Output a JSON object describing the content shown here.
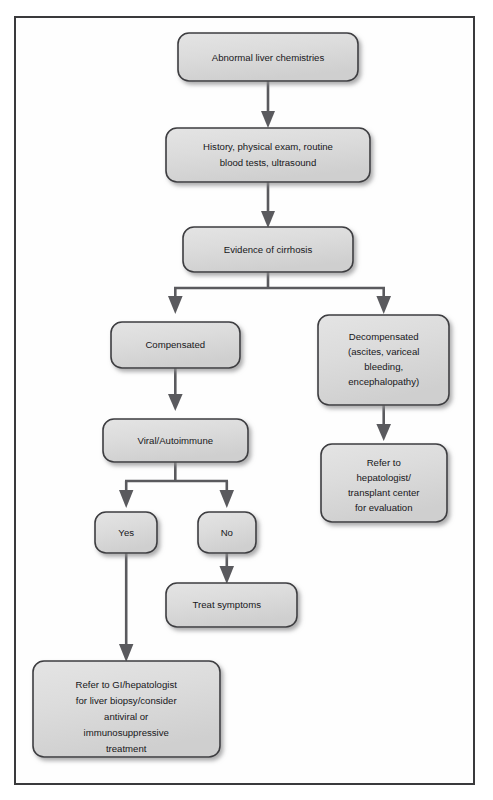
{
  "diagram": {
    "frame": {
      "border_color": "#3a3a3c",
      "background": "#ffffff"
    },
    "style": {
      "box_fill": "#d9d9d9",
      "box_stroke": "#3d3d40",
      "connector_color": "#5a5a5e",
      "text_color": "#17171a"
    },
    "nodes": [
      {
        "id": "abnormal-liver-chemistries",
        "lines": [
          "Abnormal liver chemistries"
        ]
      },
      {
        "id": "history-physical-exam",
        "lines": [
          "History, physical exam, routine",
          "blood tests, ultrasound"
        ]
      },
      {
        "id": "evidence-of-cirrhosis",
        "lines": [
          "Evidence of cirrhosis"
        ]
      },
      {
        "id": "compensated",
        "lines": [
          "Compensated"
        ]
      },
      {
        "id": "decompensated",
        "lines": [
          "Decompensated",
          "(ascites, variceal",
          "bleeding,",
          "encephalopathy)"
        ]
      },
      {
        "id": "viral-autoimmune",
        "lines": [
          "Viral/Autoimmune"
        ]
      },
      {
        "id": "refer-hepatologist-transplant",
        "lines": [
          "Refer to",
          "hepatologist/",
          "transplant center",
          "for evaluation"
        ]
      },
      {
        "id": "yes",
        "lines": [
          "Yes"
        ]
      },
      {
        "id": "no",
        "lines": [
          "No"
        ]
      },
      {
        "id": "treat-symptoms",
        "lines": [
          "Treat symptoms"
        ]
      },
      {
        "id": "refer-gi-hepatologist",
        "lines": [
          "Refer to GI/hepatologist",
          "for liver biopsy/consider",
          "antiviral or",
          "immunosuppressive",
          "treatment"
        ]
      }
    ],
    "edges": [
      {
        "from": "abnormal-liver-chemistries",
        "to": "history-physical-exam",
        "label": ""
      },
      {
        "from": "history-physical-exam",
        "to": "evidence-of-cirrhosis",
        "label": ""
      },
      {
        "from": "evidence-of-cirrhosis",
        "to": "compensated",
        "label": ""
      },
      {
        "from": "evidence-of-cirrhosis",
        "to": "decompensated",
        "label": ""
      },
      {
        "from": "compensated",
        "to": "viral-autoimmune",
        "label": ""
      },
      {
        "from": "decompensated",
        "to": "refer-hepatologist-transplant",
        "label": ""
      },
      {
        "from": "viral-autoimmune",
        "to": "yes",
        "label": ""
      },
      {
        "from": "viral-autoimmune",
        "to": "no",
        "label": ""
      },
      {
        "from": "no",
        "to": "treat-symptoms",
        "label": ""
      },
      {
        "from": "yes",
        "to": "refer-gi-hepatologist",
        "label": ""
      }
    ]
  }
}
